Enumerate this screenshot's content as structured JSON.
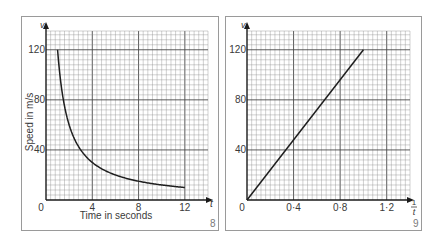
{
  "colors": {
    "background": "#ffffff",
    "frame": "#9a9a9a",
    "minor_grid": "#8c8c8c",
    "major_grid": "#4a4a4a",
    "axis": "#1a1a1a",
    "curve": "#1e1e1e",
    "text": "#3a3a3a",
    "figure_number": "#7a7a7a"
  },
  "chart_data": [
    {
      "figure_number": "8",
      "type": "line",
      "title": "",
      "xlabel": "Time in seconds",
      "ylabel": "Speed in m/s",
      "x_axis_symbol": "t",
      "y_axis_symbol": "v",
      "xlim": [
        0,
        14
      ],
      "ylim": [
        0,
        135
      ],
      "x_ticks": [
        0,
        4,
        8,
        12
      ],
      "x_tick_labels": [
        "0",
        "4",
        "8",
        "12"
      ],
      "y_ticks": [
        40,
        80,
        120
      ],
      "y_tick_labels": [
        "40",
        "80",
        "120"
      ],
      "grid": true,
      "minor_grid_step": {
        "x": 0.4,
        "y": 4
      },
      "major_grid_step": {
        "x": 4,
        "y": 40
      },
      "legend": null,
      "series": [
        {
          "name": "v = 120 / t",
          "x": [
            1,
            1.2,
            1.5,
            2,
            2.5,
            3,
            3.5,
            4,
            5,
            6,
            7,
            8,
            9,
            10,
            11,
            12
          ],
          "y": [
            120,
            100,
            80,
            60,
            48,
            40,
            34.3,
            30,
            24,
            20,
            17.1,
            15,
            13.3,
            12,
            10.9,
            10
          ]
        }
      ]
    },
    {
      "figure_number": "9",
      "type": "line",
      "title": "",
      "xlabel": "",
      "ylabel": "",
      "x_axis_symbol_num": "1",
      "x_axis_symbol_den": "t",
      "y_axis_symbol": "v",
      "xlim": [
        0,
        1.4
      ],
      "ylim": [
        0,
        135
      ],
      "x_ticks": [
        0,
        0.4,
        0.8,
        1.2
      ],
      "x_tick_labels": [
        "0",
        "0·4",
        "0·8",
        "1·2"
      ],
      "y_ticks": [
        40,
        80,
        120
      ],
      "y_tick_labels": [
        "40",
        "80",
        "120"
      ],
      "grid": true,
      "minor_grid_step": {
        "x": 0.04,
        "y": 4
      },
      "major_grid_step": {
        "x": 0.4,
        "y": 40
      },
      "legend": null,
      "series": [
        {
          "name": "v = 120 × (1/t)",
          "x": [
            0,
            1.0
          ],
          "y": [
            0,
            120
          ]
        }
      ]
    }
  ]
}
